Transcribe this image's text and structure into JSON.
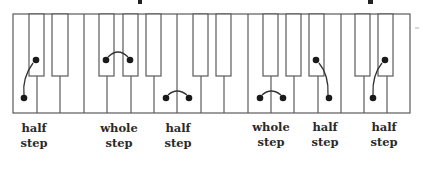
{
  "diagram": {
    "title_fragments": [
      "p",
      "p"
    ],
    "keyboard": {
      "white_key_count": 17,
      "black_keys_after_white_index": [
        0,
        1,
        3,
        4,
        5,
        7,
        8,
        10,
        11,
        12,
        14,
        15
      ],
      "colors": {
        "outline": "#5a5a5a",
        "fill": "#ffffff",
        "dot": "#1a1a1a"
      }
    },
    "pairs": [
      {
        "type": "half",
        "from": "black",
        "to": "white",
        "connector": "curve"
      },
      {
        "type": "whole",
        "from": "black",
        "to": "black",
        "connector": "arc"
      },
      {
        "type": "half",
        "from": "white",
        "to": "white",
        "connector": "arc"
      },
      {
        "type": "whole",
        "from": "white",
        "to": "white",
        "connector": "arc"
      },
      {
        "type": "half",
        "from": "black",
        "to": "white",
        "connector": "curve"
      },
      {
        "type": "half",
        "from": "black",
        "to": "white",
        "connector": "curve"
      }
    ],
    "labels": [
      {
        "line1": "half",
        "line2": "step"
      },
      {
        "line1": "whole",
        "line2": "step"
      },
      {
        "line1": "half",
        "line2": "step"
      },
      {
        "line1": "whole",
        "line2": "step"
      },
      {
        "line1": "half",
        "line2": "step"
      },
      {
        "line1": "half",
        "line2": "step"
      }
    ]
  }
}
